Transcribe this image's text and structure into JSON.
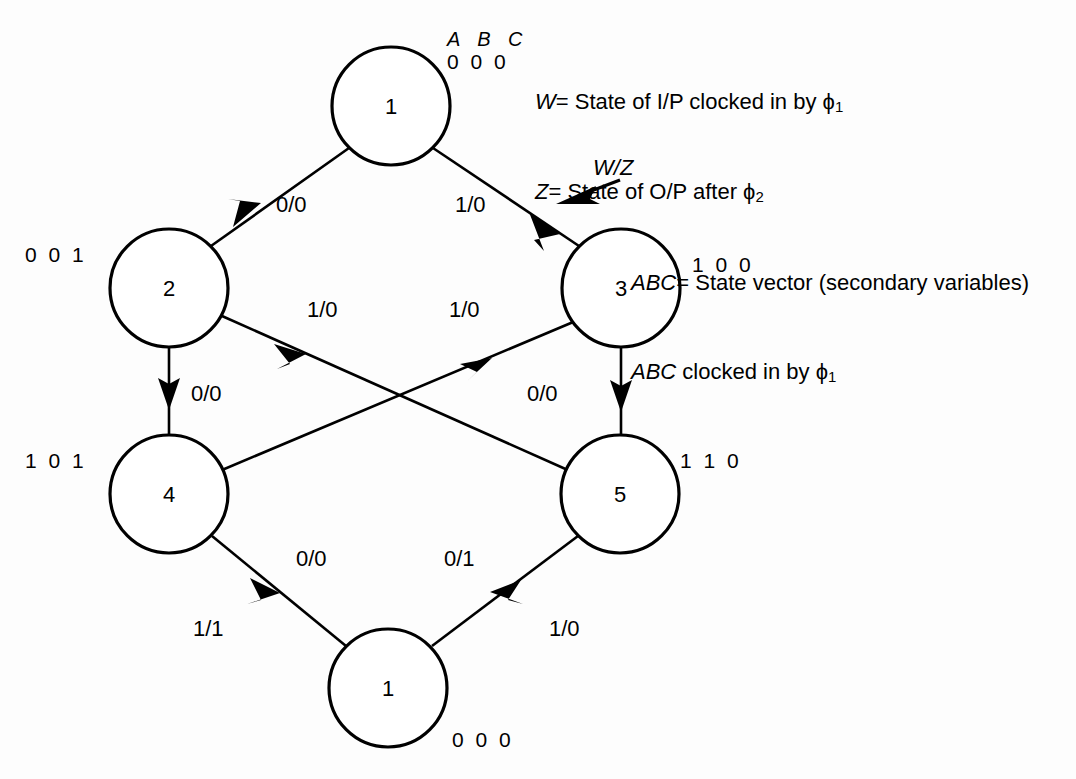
{
  "diagram": {
    "abc_header": "A B C",
    "legend": {
      "line1_symbol": "W",
      "line1_text": "= State of I/P clocked in by ϕ",
      "line1_sub": "1",
      "line2_symbol": "Z",
      "line2_text": "= State of O/P after ϕ",
      "line2_sub": "2",
      "line3_symbol": "ABC",
      "line3_text": "= State vector (secondary variables)",
      "line4_symbol": "ABC",
      "line4_text": " clocked in by ϕ",
      "line4_sub": "1"
    },
    "wz_annotation": "W/Z",
    "nodes": [
      {
        "id": "node-top",
        "label": "1",
        "state_vector": "0 0 0",
        "cx": 391,
        "cy": 106,
        "r": 59
      },
      {
        "id": "node-2",
        "label": "2",
        "state_vector": "0 0 1",
        "cx": 169,
        "cy": 288,
        "r": 59
      },
      {
        "id": "node-3",
        "label": "3",
        "state_vector": "1 0 0",
        "cx": 621,
        "cy": 288,
        "r": 59
      },
      {
        "id": "node-4",
        "label": "4",
        "state_vector": "1 0 1",
        "cx": 169,
        "cy": 494,
        "r": 59
      },
      {
        "id": "node-5",
        "label": "5",
        "state_vector": "1 1 0",
        "cx": 620,
        "cy": 494,
        "r": 59
      },
      {
        "id": "node-bottom",
        "label": "1",
        "state_vector": "0 0 0",
        "cx": 388,
        "cy": 688,
        "r": 59
      }
    ],
    "edges": [
      {
        "id": "edge-1-2",
        "from": "node-top",
        "to": "node-2",
        "label": "0/0"
      },
      {
        "id": "edge-1-3",
        "from": "node-top",
        "to": "node-3",
        "label": "1/0"
      },
      {
        "id": "edge-2-4",
        "from": "node-2",
        "to": "node-4",
        "label": "0/0"
      },
      {
        "id": "edge-3-5",
        "from": "node-3",
        "to": "node-5",
        "label": "0/0"
      },
      {
        "id": "edge-2-5",
        "from": "node-2",
        "to": "node-5",
        "label": "1/0"
      },
      {
        "id": "edge-4-3",
        "from": "node-4",
        "to": "node-3",
        "label": "1/0"
      },
      {
        "id": "edge-4-1",
        "from": "node-4",
        "to": "node-bottom",
        "label": "0/0",
        "label2": "1/1"
      },
      {
        "id": "edge-5-1",
        "from": "node-5",
        "to": "node-bottom",
        "label": "0/1",
        "label2": "1/0"
      }
    ],
    "colors": {
      "stroke": "#000000",
      "background": "#ffffff",
      "text": "#000000"
    }
  }
}
